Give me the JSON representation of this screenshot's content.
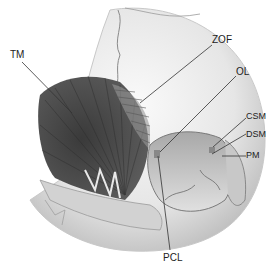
{
  "figure": {
    "labels": [
      {
        "id": "TM",
        "text": "TM",
        "x": 10,
        "y": 50
      },
      {
        "id": "ZOF",
        "text": "ZOF",
        "x": 212,
        "y": 35
      },
      {
        "id": "OL",
        "text": "OL",
        "x": 236,
        "y": 67
      },
      {
        "id": "CSM",
        "text": "CSM",
        "x": 246,
        "y": 112
      },
      {
        "id": "DSM",
        "text": "DSM",
        "x": 246,
        "y": 130
      },
      {
        "id": "PM",
        "text": "PM",
        "x": 246,
        "y": 151
      },
      {
        "id": "PCL",
        "text": "PCL",
        "x": 166,
        "y": 253
      }
    ],
    "colors": {
      "muscle": "#4a4a4a",
      "bone": "#d9d9d9",
      "bone_shadow": "#9a9a9a",
      "leader": "#333333",
      "suture": "#7a7a7a"
    }
  }
}
